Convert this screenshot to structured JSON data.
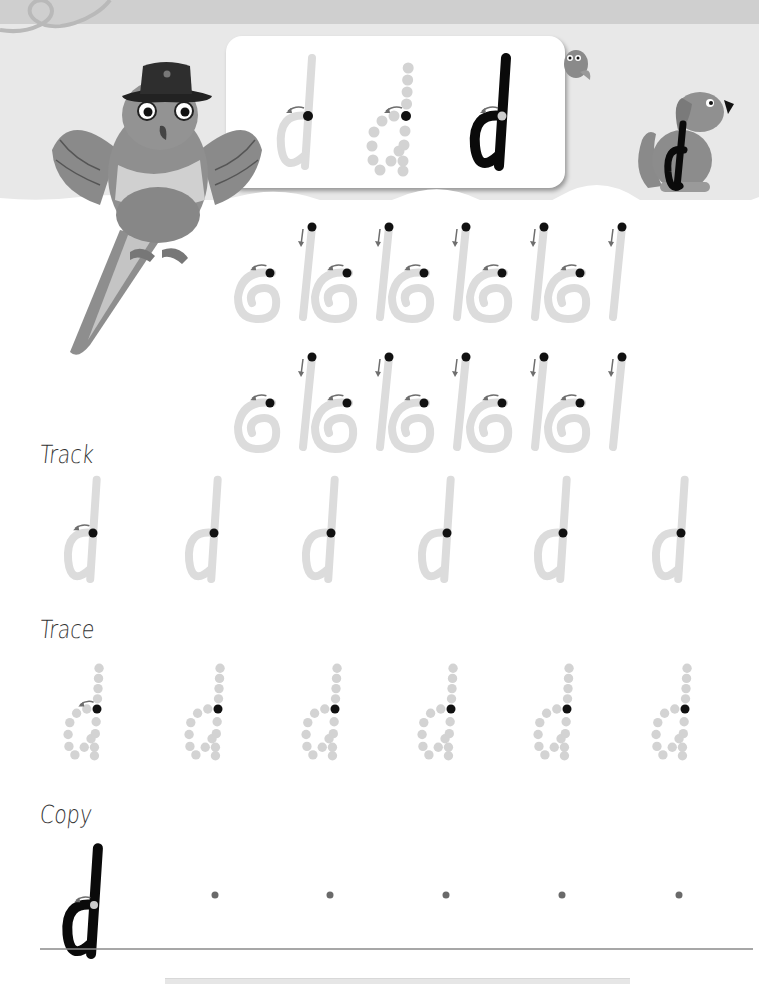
{
  "worksheet": {
    "letter": "d",
    "colors": {
      "header_band": "#cfcfcf",
      "header_panel": "#e8e8e8",
      "guide_stroke": "#dcdcdc",
      "dotted_guide": "#d3d3d3",
      "start_dot": "#111111",
      "model_ink": "#0a0a0a",
      "arrow": "#6e6e6e",
      "copy_dot": "#6a6a6a",
      "baseline": "#8a8a8a",
      "label_text": "#333333"
    },
    "model_card": {
      "letters": [
        {
          "style": "faint",
          "x": 300
        },
        {
          "style": "dotted",
          "x": 390
        },
        {
          "style": "bold",
          "x": 490
        }
      ]
    },
    "illustrations": [
      {
        "name": "parrot-with-hat",
        "role": "mascot"
      },
      {
        "name": "small-bird",
        "role": "decoration"
      },
      {
        "name": "dog-with-letter-d",
        "role": "letter-picture",
        "letter": "d"
      }
    ],
    "stroke_practice": {
      "rows": [
        {
          "y": 227,
          "pairs": [
            272,
            349,
            426,
            504,
            582
          ]
        },
        {
          "y": 357,
          "pairs": [
            272,
            349,
            426,
            504,
            582
          ]
        }
      ]
    },
    "sections": [
      {
        "id": "track",
        "label": "Track",
        "label_y": 440,
        "start_dot_y": 533,
        "letter_xs": [
          80,
          201,
          318,
          434,
          550,
          668
        ]
      },
      {
        "id": "trace",
        "label": "Trace",
        "label_y": 615,
        "start_dot_y": 709,
        "letter_xs": [
          80,
          201,
          318,
          434,
          550,
          668
        ]
      },
      {
        "id": "copy",
        "label": "Copy",
        "label_y": 800,
        "start_dot_y": 895,
        "model_x": 80,
        "guide_dot_xs": [
          215,
          330,
          446,
          562,
          679
        ],
        "baseline_y": 949
      }
    ]
  }
}
